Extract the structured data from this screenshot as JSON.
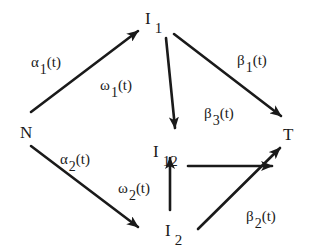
{
  "diagram": {
    "nodes": {
      "N": {
        "base": "N",
        "sub": ""
      },
      "I1": {
        "base": "I",
        "sub": "1"
      },
      "I12": {
        "base": "I",
        "sub": "12"
      },
      "I2": {
        "base": "I",
        "sub": "2"
      },
      "T": {
        "base": "T",
        "sub": ""
      }
    },
    "edges": [
      {
        "from": "N",
        "to": "I1",
        "label": {
          "sym": "α",
          "sub": "1",
          "arg": "(t)"
        }
      },
      {
        "from": "N",
        "to": "I2",
        "label": {
          "sym": "α",
          "sub": "2",
          "arg": "(t)"
        }
      },
      {
        "from": "I1",
        "to": "I12",
        "label": {
          "sym": "ω",
          "sub": "1",
          "arg": "(t)"
        }
      },
      {
        "from": "I2",
        "to": "I12",
        "label": {
          "sym": "ω",
          "sub": "2",
          "arg": "(t)"
        }
      },
      {
        "from": "I1",
        "to": "T",
        "label": {
          "sym": "β",
          "sub": "1",
          "arg": "(t)"
        }
      },
      {
        "from": "I12",
        "to": "T",
        "label": {
          "sym": "β",
          "sub": "3",
          "arg": "(t)"
        }
      },
      {
        "from": "I2",
        "to": "T",
        "label": {
          "sym": "β",
          "sub": "2",
          "arg": "(t)"
        }
      }
    ],
    "stroke_color": "#1a1a1a",
    "background": "#ffffff"
  }
}
